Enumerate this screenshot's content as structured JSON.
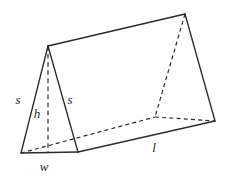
{
  "figure": {
    "background_color": "#ffffff",
    "stroke_color": "#2b2b2b",
    "width_px": 229,
    "height_px": 178
  },
  "labels": {
    "slant_left": "s",
    "slant_right": "s",
    "height": "h",
    "width": "w",
    "length": "l"
  },
  "label_positions": {
    "slant_left": {
      "x": 18,
      "y": 99
    },
    "slant_right": {
      "x": 70,
      "y": 99
    },
    "height": {
      "x": 37,
      "y": 113
    },
    "width": {
      "x": 44,
      "y": 166
    },
    "length": {
      "x": 154,
      "y": 147
    }
  },
  "geometry": {
    "vertices": {
      "front_apex": {
        "x": 48,
        "y": 46
      },
      "front_bottom_left": {
        "x": 21,
        "y": 153
      },
      "front_bottom_right": {
        "x": 78,
        "y": 152
      },
      "back_apex": {
        "x": 185,
        "y": 14
      },
      "back_bottom_left": {
        "x": 155,
        "y": 117
      },
      "back_bottom_right": {
        "x": 215,
        "y": 121
      },
      "altitude_foot": {
        "x": 48,
        "y": 153
      }
    },
    "solid_edges": [
      [
        "front_apex",
        "front_bottom_left"
      ],
      [
        "front_apex",
        "front_bottom_right"
      ],
      [
        "front_bottom_left",
        "front_bottom_right"
      ],
      [
        "front_apex",
        "back_apex"
      ],
      [
        "back_apex",
        "back_bottom_right"
      ],
      [
        "front_bottom_right",
        "back_bottom_right"
      ]
    ],
    "hidden_edges": [
      [
        "back_apex",
        "back_bottom_left"
      ],
      [
        "back_bottom_left",
        "back_bottom_right"
      ],
      [
        "front_bottom_left",
        "back_bottom_left"
      ]
    ],
    "altitude_edge": [
      "front_apex",
      "altitude_foot"
    ]
  }
}
